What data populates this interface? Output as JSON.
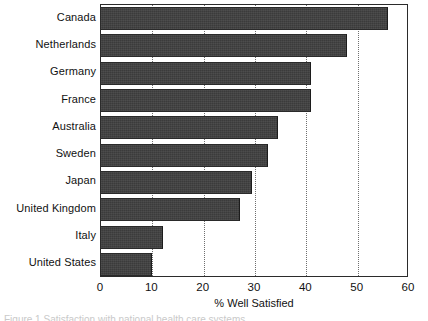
{
  "chart_data": {
    "type": "bar",
    "orientation": "horizontal",
    "title": "",
    "xlabel": "% Well Satisfied",
    "ylabel": "",
    "xlim": [
      0,
      60
    ],
    "xticks": [
      0,
      10,
      20,
      30,
      40,
      50,
      60
    ],
    "xtick_labels": [
      "0",
      "10",
      "20",
      "30",
      "40",
      "50",
      "60"
    ],
    "grid": "vertical-dotted",
    "legend": "none",
    "bar_color": "#3b3b3b",
    "categories": [
      "Canada",
      "Netherlands",
      "Germany",
      "France",
      "Australia",
      "Sweden",
      "Japan",
      "United Kingdom",
      "Italy",
      "United States"
    ],
    "values": [
      56,
      48,
      41,
      41,
      34.5,
      32.5,
      29.5,
      27,
      12,
      10
    ]
  },
  "caption": {
    "clipped_text": "Figure 1 Satisfaction with national health care systems"
  }
}
